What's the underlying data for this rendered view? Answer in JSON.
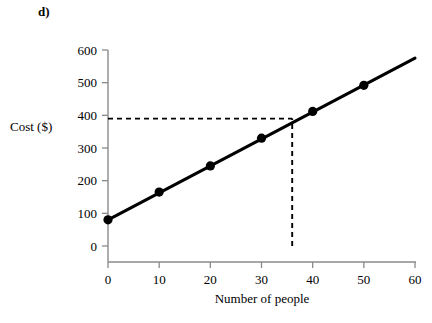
{
  "figure": {
    "panel_label": "d)",
    "background_color": "#ffffff"
  },
  "chart_data": {
    "type": "line",
    "title": "",
    "subtitle": "",
    "xlabel": "Number of people",
    "ylabel": "Cost ($)",
    "xlim": [
      0,
      60
    ],
    "ylim": [
      0,
      600
    ],
    "xticks": [
      0,
      10,
      20,
      30,
      40,
      50,
      60
    ],
    "yticks": [
      0,
      100,
      200,
      300,
      400,
      500,
      600
    ],
    "xtick_labels": [
      "0",
      "10",
      "20",
      "30",
      "40",
      "50",
      "60"
    ],
    "ytick_labels": [
      "0",
      "100",
      "200",
      "300",
      "400",
      "500",
      "600"
    ],
    "grid": false,
    "legend": null,
    "legend_position": "none",
    "line_color": "#000000",
    "marker_color": "#000000",
    "marker_style": "filled-circle",
    "x": [
      0,
      10,
      20,
      30,
      40,
      50
    ],
    "values": [
      80,
      165,
      245,
      330,
      412,
      492
    ],
    "series": [
      {
        "name": "Cost",
        "x": [
          0,
          10,
          20,
          30,
          40,
          50
        ],
        "values": [
          80,
          165,
          245,
          330,
          412,
          492
        ]
      }
    ],
    "line_extent": {
      "x_start": 0,
      "y_start": 80,
      "x_end": 60,
      "y_end": 575
    },
    "annotations": [
      {
        "type": "dashed-guide",
        "name": "cost-guide",
        "orientation": "horizontal",
        "value": 390,
        "from_x": 0,
        "to_x": 36,
        "color": "#000000"
      },
      {
        "type": "dashed-guide",
        "name": "people-guide",
        "orientation": "vertical",
        "value": 36,
        "from_y": 0,
        "to_y": 390,
        "color": "#000000"
      }
    ]
  }
}
